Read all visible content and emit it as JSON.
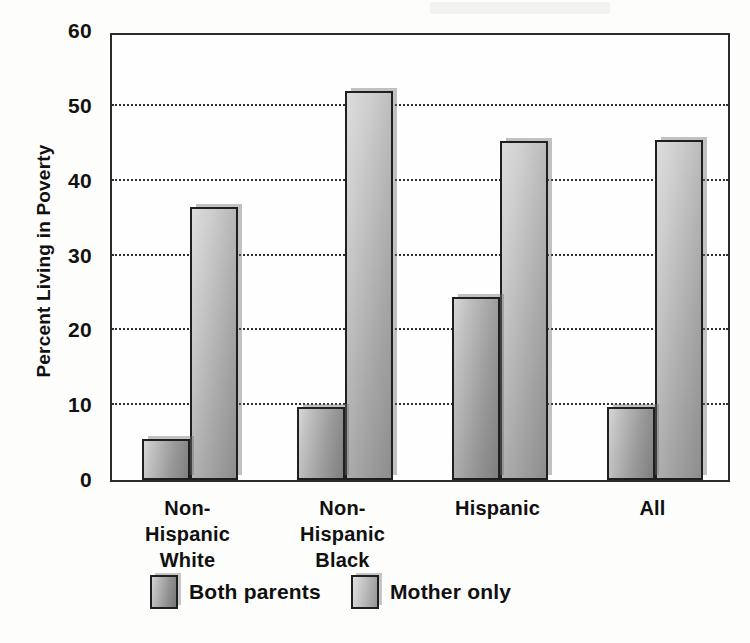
{
  "chart_data": {
    "type": "bar",
    "title": "",
    "xlabel": "",
    "ylabel": "Percent Living in Poverty",
    "ylim": [
      0,
      60
    ],
    "yticks": [
      0,
      10,
      20,
      30,
      40,
      50,
      60
    ],
    "ytick_labels": [
      "0",
      "10",
      "20",
      "30",
      "40",
      "50",
      "60"
    ],
    "gridlines": [
      10,
      20,
      30,
      40,
      50
    ],
    "grid": true,
    "legend_position": "bottom",
    "categories": [
      "Non-\nHispanic\nWhite",
      "Non-\nHispanic\nBlack",
      "Hispanic",
      "All"
    ],
    "category_labels": [
      [
        "Non-",
        "Hispanic",
        "White"
      ],
      [
        "Non-",
        "Hispanic",
        "Black"
      ],
      [
        "Hispanic"
      ],
      [
        "All"
      ]
    ],
    "series": [
      {
        "name": "Both parents",
        "color": "#9a9a9a",
        "values": [
          5.5,
          9.8,
          24.5,
          9.8
        ]
      },
      {
        "name": "Mother only",
        "color": "#b4b4b4",
        "values": [
          36.5,
          52.0,
          45.3,
          45.5
        ]
      }
    ]
  },
  "legend": {
    "entries": [
      {
        "label": "Both parents",
        "swatch": "legend-swatch-both-parents"
      },
      {
        "label": "Mother only",
        "swatch": "legend-swatch-mother-only"
      }
    ]
  },
  "colors": {
    "axis": "#2b2b2b",
    "grid": "#2f2f2f",
    "text": "#101010",
    "background": "#fdfdfc"
  }
}
